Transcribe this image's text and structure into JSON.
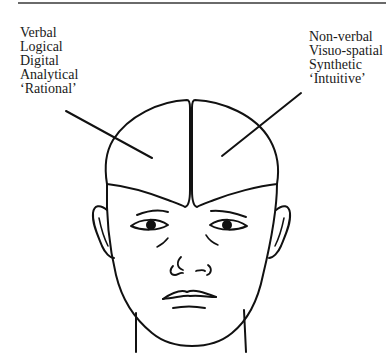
{
  "diagram": {
    "left_hemisphere": {
      "labels": [
        "Verbal",
        "Logical",
        "Digital",
        "Analytical",
        "‘Rational’"
      ]
    },
    "right_hemisphere": {
      "labels": [
        "Non-verbal",
        "Visuo-spatial",
        "Synthetic",
        "‘Intuitive’"
      ]
    },
    "stroke_color": "#111111"
  }
}
